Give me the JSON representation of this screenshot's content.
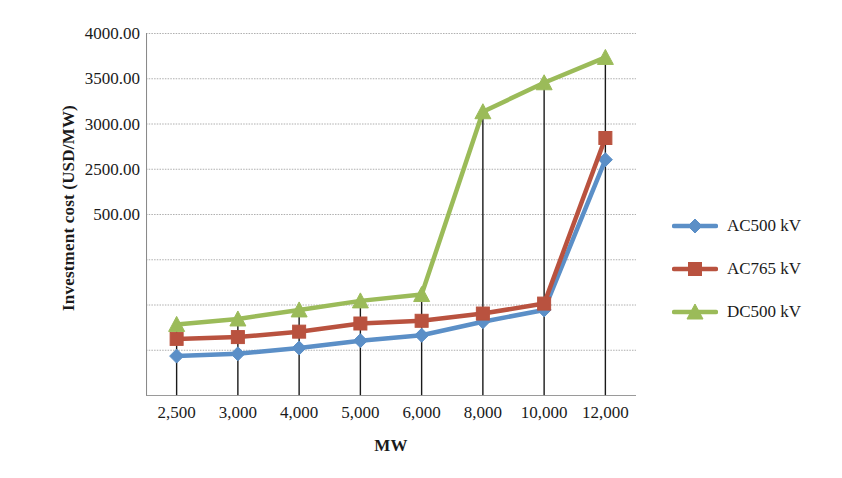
{
  "chart_data": {
    "type": "line",
    "title": "",
    "xlabel": "MW",
    "ylabel": "Investment cost (USD/MW)",
    "categories": [
      "2,500",
      "3,000",
      "4,000",
      "5,000",
      "6,000",
      "8,000",
      "10,000",
      "12,000"
    ],
    "x_values": [
      2500,
      3000,
      4000,
      5000,
      6000,
      8000,
      10000,
      12000
    ],
    "y_tick_labels": [
      "4000.00",
      "3500.00",
      "3000.00",
      "2500.00",
      "500.00"
    ],
    "y_tick_values": [
      4000,
      3500,
      3000,
      2500,
      2000
    ],
    "ylim": [
      0,
      4000
    ],
    "grid": true,
    "legend_position": "right",
    "drop_lines": true,
    "series": [
      {
        "name": "AC500 kV",
        "color": "#5b8fc7",
        "marker": "diamond",
        "values": [
          430,
          455,
          520,
          600,
          660,
          810,
          940,
          2600
        ]
      },
      {
        "name": "AC765 kV",
        "color": "#b9523f",
        "marker": "square",
        "values": [
          620,
          640,
          700,
          790,
          820,
          900,
          1010,
          2840
        ]
      },
      {
        "name": "DC500 kV",
        "color": "#9bbb59",
        "marker": "triangle",
        "values": [
          780,
          840,
          940,
          1040,
          1110,
          3130,
          3450,
          3730
        ]
      }
    ]
  },
  "legend": {
    "items": [
      {
        "label": "AC500 kV",
        "color": "#5b8fc7",
        "marker": "diamond"
      },
      {
        "label": "AC765 kV",
        "color": "#b9523f",
        "marker": "square"
      },
      {
        "label": "DC500 kV",
        "color": "#9bbb59",
        "marker": "triangle"
      }
    ]
  },
  "axes": {
    "y_title": "Investment cost (USD/MW)",
    "x_title": "MW"
  }
}
